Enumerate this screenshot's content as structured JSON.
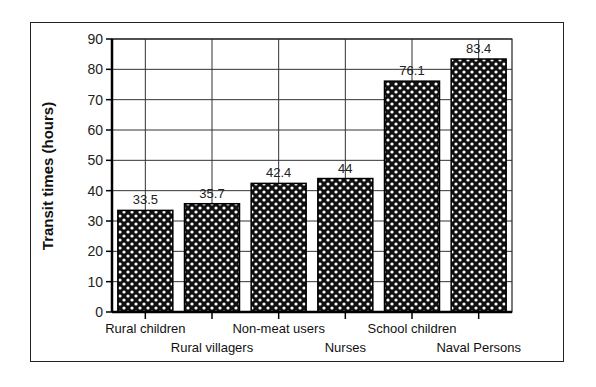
{
  "chart_data": {
    "type": "bar",
    "title": "",
    "xlabel": "",
    "ylabel": "Transit times (hours)",
    "ylim": [
      0,
      90
    ],
    "yticks": [
      0,
      10,
      20,
      30,
      40,
      50,
      60,
      70,
      80,
      90
    ],
    "grid": true,
    "legend": null,
    "categories": [
      "Rural children",
      "Rural villagers",
      "Non-meat users",
      "Nurses",
      "School children",
      "Naval Persons"
    ],
    "values": [
      33.5,
      35.7,
      42.4,
      44,
      76.1,
      83.4
    ],
    "data_labels": [
      "33.5",
      "35.7",
      "42.4",
      "44",
      "76.1",
      "83.4"
    ],
    "bar_fill": "black dotted halftone pattern"
  },
  "colors": {
    "bar": "#111111",
    "bar_dots": "#ffffff",
    "grid": "#333333",
    "axis": "#000000",
    "background": "#ffffff"
  }
}
